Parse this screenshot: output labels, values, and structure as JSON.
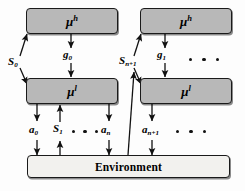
{
  "diagram": {
    "colors": {
      "agent_fill": "#b8b8b8",
      "env_fill": "#f2f1ee",
      "stroke": "#1a1a1a",
      "background": "#fdfdfd"
    },
    "nodes": {
      "high_level_left": {
        "label": "μ",
        "superscript": "h"
      },
      "high_level_right": {
        "label": "μ",
        "superscript": "h"
      },
      "low_level_left": {
        "label": "μ",
        "superscript": "l"
      },
      "low_level_right": {
        "label": "μ",
        "superscript": "l"
      },
      "environment": {
        "label": "Environment"
      }
    },
    "edge_labels": {
      "state_0": {
        "base": "S",
        "sub": "0"
      },
      "goal_0": {
        "base": "g",
        "sub": "0"
      },
      "action_0": {
        "base": "a",
        "sub": "0"
      },
      "state_1": {
        "base": "S",
        "sub": "1"
      },
      "action_n": {
        "base": "a",
        "sub": "n"
      },
      "state_n_plus_1": {
        "base": "S",
        "sub": "n+1"
      },
      "goal_1": {
        "base": "g",
        "sub": "1"
      },
      "action_n_plus_1": {
        "base": "a",
        "sub": "n+1"
      }
    },
    "ellipses": {
      "top_right": 3,
      "bottom_left": 3,
      "bottom_right": 3
    }
  }
}
